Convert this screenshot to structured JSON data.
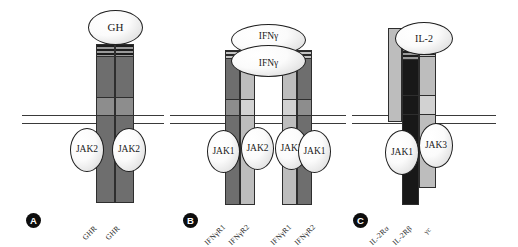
{
  "figure": {
    "membrane_label": "plasma-membrane",
    "colors": {
      "membrane_line": "#3a3a3a",
      "column_dark": "#6e6e6e",
      "column_mid": "#8d8d8d",
      "column_light": "#bdbdbd",
      "column_pale": "#d2d2d2",
      "column_black": "#181818",
      "ellipse_fill": "#f7f7f7",
      "outline": "#1f1f1f",
      "panel_marker_bg": "#0d0d0d",
      "panel_marker_fg": "#ffffff"
    }
  },
  "panels": [
    {
      "id": "A",
      "letter": "A",
      "ligands": [
        {
          "label": "GH"
        }
      ],
      "kinases": [
        {
          "label": "JAK2"
        },
        {
          "label": "JAK2"
        }
      ],
      "receptors": [
        {
          "label": "GHR"
        },
        {
          "label": "GHR"
        }
      ]
    },
    {
      "id": "B",
      "letter": "B",
      "ligands": [
        {
          "label": "IFNγ"
        },
        {
          "label": "IFNγ"
        }
      ],
      "kinases": [
        {
          "label": "JAK1"
        },
        {
          "label": "JAK2"
        },
        {
          "label": "JAK2"
        },
        {
          "label": "JAK1"
        }
      ],
      "receptors": [
        {
          "label": "IFNγR1"
        },
        {
          "label": "IFNγR2"
        },
        {
          "label": "IFNγR1"
        },
        {
          "label": "IFNγR2"
        }
      ]
    },
    {
      "id": "C",
      "letter": "C",
      "ligands": [
        {
          "label": "IL-2"
        }
      ],
      "kinases": [
        {
          "label": "JAK1"
        },
        {
          "label": "JAK3"
        }
      ],
      "receptors": [
        {
          "label": "IL-2Rα"
        },
        {
          "label": "IL-2Rβ"
        },
        {
          "label": "γc"
        }
      ]
    }
  ]
}
